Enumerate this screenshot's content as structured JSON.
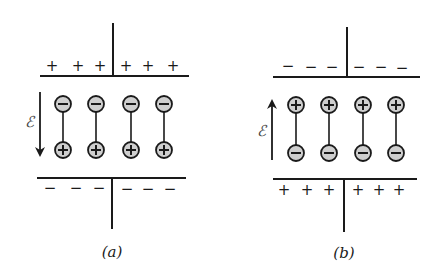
{
  "diagrams": [
    {
      "id": "a",
      "caption": "(a)",
      "field_symbol": "ℰ",
      "field_direction": "down",
      "top_plate": {
        "charge": "+",
        "signs": [
          "+",
          "+",
          "+",
          "+",
          "+",
          "+"
        ]
      },
      "bottom_plate": {
        "charge": "−",
        "signs": [
          "−",
          "−",
          "−",
          "−",
          "−",
          "−"
        ]
      },
      "dipoles": [
        {
          "top": "−",
          "bottom": "+"
        },
        {
          "top": "−",
          "bottom": "+"
        },
        {
          "top": "−",
          "bottom": "+"
        },
        {
          "top": "−",
          "bottom": "+"
        }
      ]
    },
    {
      "id": "b",
      "caption": "(b)",
      "field_symbol": "ℰ",
      "field_direction": "up",
      "top_plate": {
        "charge": "−",
        "signs": [
          "−",
          "−",
          "−",
          "−",
          "−",
          "−"
        ]
      },
      "bottom_plate": {
        "charge": "+",
        "signs": [
          "+",
          "+",
          "+",
          "+",
          "+",
          "+"
        ]
      },
      "dipoles": [
        {
          "top": "+",
          "bottom": "−"
        },
        {
          "top": "+",
          "bottom": "−"
        },
        {
          "top": "+",
          "bottom": "−"
        },
        {
          "top": "+",
          "bottom": "−"
        }
      ]
    }
  ],
  "colors": {
    "ink": "#1a1a1a",
    "charge_fill": "#cfcfcf",
    "background": "#ffffff"
  }
}
